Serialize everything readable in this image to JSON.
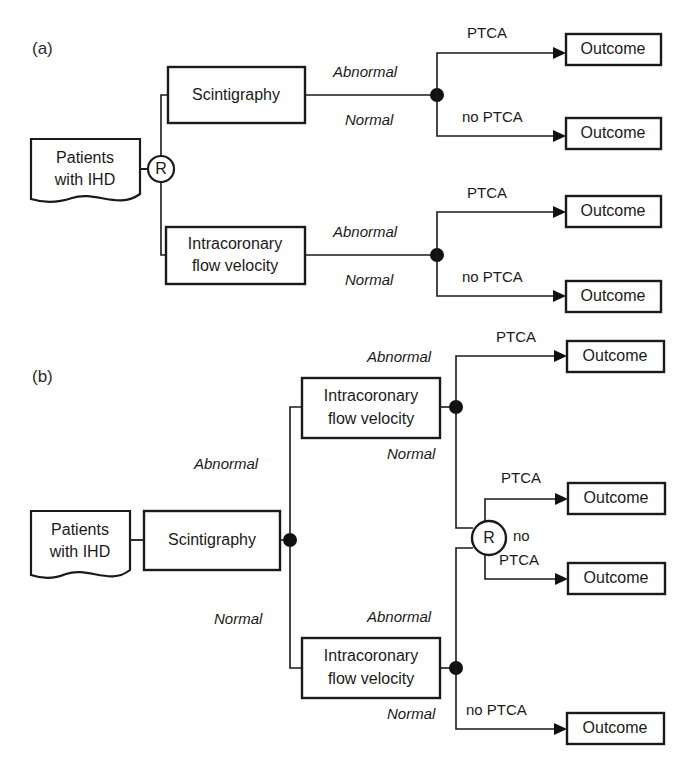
{
  "figure": {
    "type": "decision-tree-diagram",
    "panels": [
      {
        "id": "a",
        "label": "(a)",
        "design": "randomized comparison of two diagnostic tests, each followed by a treatment decision based on test result",
        "start_node": {
          "name": "patients-source",
          "text_line1": "Patients",
          "text_line2": "with IHD",
          "shape": "document"
        },
        "randomization": {
          "name": "randomization-node-a",
          "symbol": "R"
        },
        "arms": [
          {
            "test": {
              "name": "scintigraphy-box",
              "text": "Scintigraphy"
            },
            "result_node": {
              "symbol": "filled-circle"
            },
            "branches": [
              {
                "result": "Abnormal",
                "treatment": "PTCA",
                "outcome": "Outcome"
              },
              {
                "result": "Normal",
                "treatment": "no PTCA",
                "outcome": "Outcome"
              }
            ]
          },
          {
            "test": {
              "name": "intracoronary-flow-velocity-box",
              "text_line1": "Intracoronary",
              "text_line2": "flow velocity"
            },
            "result_node": {
              "symbol": "filled-circle"
            },
            "branches": [
              {
                "result": "Abnormal",
                "treatment": "PTCA",
                "outcome": "Outcome"
              },
              {
                "result": "Normal",
                "treatment": "no PTCA",
                "outcome": "Outcome"
              }
            ]
          }
        ]
      },
      {
        "id": "b",
        "label": "(b)",
        "design": "sequential testing: scintigraphy followed by intracoronary flow velocity, with randomization only for the discordant group",
        "start_node": {
          "name": "patients-source",
          "text_line1": "Patients",
          "text_line2": "with IHD",
          "shape": "document"
        },
        "first_test": {
          "name": "scintigraphy-box",
          "text": "Scintigraphy"
        },
        "first_result_node": {
          "symbol": "filled-circle"
        },
        "branches": [
          {
            "result": "Abnormal",
            "second_test": {
              "name": "intracoronary-flow-velocity-box-upper",
              "text_line1": "Intracoronary",
              "text_line2": "flow velocity"
            },
            "result_node": {
              "symbol": "filled-circle"
            },
            "sub_branches": [
              {
                "result": "Abnormal",
                "treatment": "PTCA",
                "outcome": "Outcome"
              },
              {
                "result": "Normal",
                "goes_to": "randomization-node-b"
              }
            ]
          },
          {
            "result": "Normal",
            "second_test": {
              "name": "intracoronary-flow-velocity-box-lower",
              "text_line1": "Intracoronary",
              "text_line2": "flow velocity"
            },
            "result_node": {
              "symbol": "filled-circle"
            },
            "sub_branches": [
              {
                "result": "Abnormal",
                "goes_to": "randomization-node-b"
              },
              {
                "result": "Normal",
                "treatment": "no PTCA",
                "outcome": "Outcome"
              }
            ]
          }
        ],
        "randomization": {
          "name": "randomization-node-b",
          "symbol": "R",
          "arms": [
            {
              "treatment": "PTCA",
              "outcome": "Outcome"
            },
            {
              "treatment_line1": "no",
              "treatment_line2": "PTCA",
              "outcome": "Outcome"
            }
          ]
        }
      }
    ],
    "labels": {
      "abnormal": "Abnormal",
      "normal": "Normal",
      "ptca": "PTCA",
      "no_ptca": "no PTCA",
      "no": "no",
      "outcome": "Outcome",
      "r": "R",
      "patients_l1": "Patients",
      "patients_l2": "with IHD",
      "scintigraphy": "Scintigraphy",
      "icfv_l1": "Intracoronary",
      "icfv_l2": "flow velocity",
      "panel_a": "(a)",
      "panel_b": "(b)"
    },
    "colors": {
      "stroke": "#1a1a1a",
      "fill": "#ffffff",
      "text": "#1a1a1a",
      "background": "#ffffff"
    }
  }
}
